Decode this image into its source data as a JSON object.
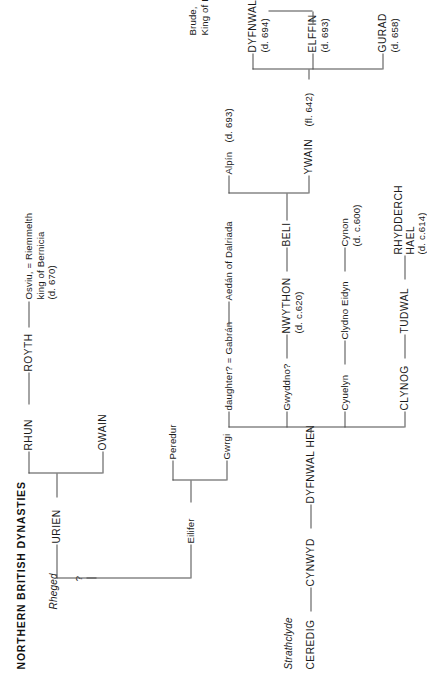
{
  "page": {
    "title": "NORTHERN BRITISH DYNASTIES"
  },
  "regions": {
    "rheged": "Rheged",
    "strathclyde": "Strathclyde"
  },
  "rheged_tree": {
    "root": {
      "label": "?"
    },
    "generation2": [
      {
        "label": "URIEN"
      },
      {
        "label": "Eilifer"
      }
    ],
    "urien_children": [
      {
        "label": "RHUN"
      },
      {
        "label": "OWAIN"
      }
    ],
    "eilifer_children": [
      {
        "label": "Gwrgi"
      },
      {
        "label": "Peredur"
      }
    ],
    "rhun_child": {
      "label": "ROYTH"
    },
    "royth_child": {
      "line1": "Osviu, = Riemmelth",
      "line2": "king of Bernicia",
      "line3": "(d. 670)"
    }
  },
  "strathclyde_tree": {
    "ceredig": {
      "label": "CEREDIG"
    },
    "cynwyd": {
      "label": "CYNWYD"
    },
    "dyfnwal_hen": {
      "label": "DYFNWAL HEN"
    },
    "dyfnwal_children": [
      {
        "label": "CLYNOG"
      },
      {
        "label": "Cyuelyn"
      },
      {
        "label": "Gwyddno?"
      },
      {
        "label": "daughter? = Gabrán"
      }
    ],
    "clynog_child": {
      "label": "TUDWAL"
    },
    "cyuelyn_child": {
      "label": "Clydno Eidyn"
    },
    "gwyddno_child": {
      "name": "NWYTHON",
      "dates": "(d. c.620)"
    },
    "daughter_child": {
      "label": "Aedán of Dalriada"
    },
    "tudwal_child": {
      "name": "RHYDDERCH",
      "name2": "HAEL",
      "dates": "(d. c.614)"
    },
    "clydno_child": {
      "name": "Cynon",
      "dates": "(d. c.600)"
    },
    "nwython_child": {
      "label": "BELI"
    },
    "beli_children": [
      {
        "name": "YWAIN",
        "dates": "(fl. 642)"
      },
      {
        "name": "Alpín",
        "dates": "(d. 693)"
      }
    ],
    "ywain_children": [
      {
        "name": "GURAD",
        "dates": "(d. 658)"
      },
      {
        "name": "ELFFIN",
        "dates": "(d. 693)"
      },
      {
        "name": "DYFNWAL",
        "dates": "(d. 694)"
      }
    ],
    "elffin_child": {
      "line1": "Brude,",
      "line2": "King of Picts"
    }
  }
}
